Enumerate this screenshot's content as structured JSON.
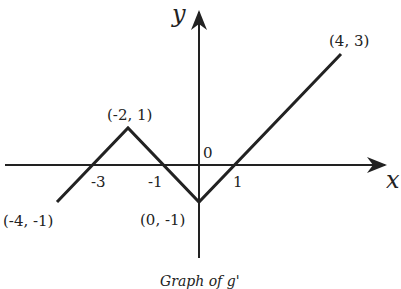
{
  "chart_data": {
    "type": "line",
    "title": "Graph of g'",
    "xlabel": "x",
    "ylabel": "y",
    "series": [
      {
        "name": "g'",
        "x": [
          -4,
          -2,
          0,
          4
        ],
        "y": [
          -1,
          1,
          -1,
          3
        ]
      }
    ],
    "point_labels": [
      "(-4, -1)",
      "(-2, 1)",
      "(0, -1)",
      "(4, 3)"
    ],
    "x_ticks": [
      {
        "value": -3,
        "label": "-3"
      },
      {
        "value": -1,
        "label": "-1"
      },
      {
        "value": 1,
        "label": "1"
      }
    ],
    "origin_label": "0",
    "grid": false,
    "legend": "none"
  }
}
